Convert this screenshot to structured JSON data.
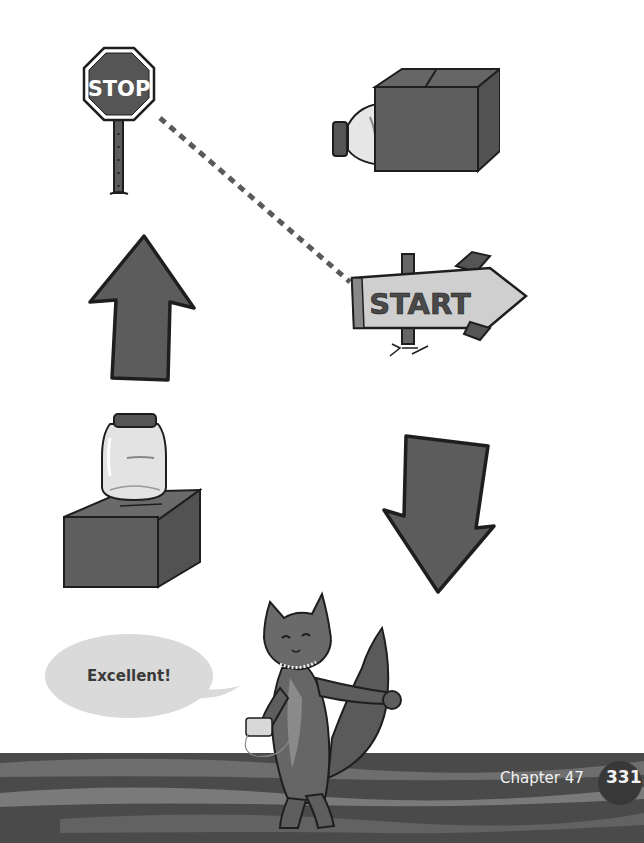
{
  "page": {
    "chapter_label": "Chapter 47",
    "page_number": "331"
  },
  "illustrations": {
    "stop_sign": {
      "text": "STOP"
    },
    "start_sign": {
      "text": "START"
    },
    "speech_bubble": {
      "text": "Excellent!"
    }
  },
  "colors": {
    "dark_fill": "#5c5c5c",
    "outline": "#1e1e1e",
    "light_gray": "#cfcfcf",
    "footer_band": "#4a4a4a"
  }
}
